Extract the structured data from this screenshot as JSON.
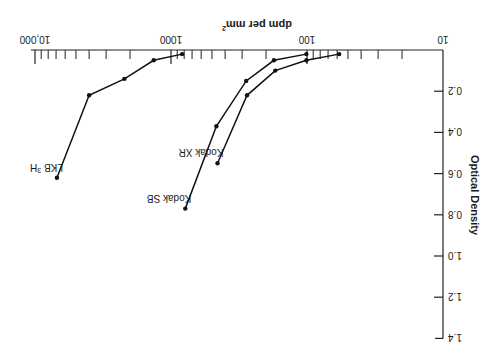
{
  "chart_data": {
    "type": "line",
    "title": "",
    "orientation_note_visible": "image rendered rotated 180 degrees",
    "xlabel": "dpm per mm²",
    "xlabel_main": "dpm per mm",
    "xlabel_sup": "2",
    "ylabel": "Optical Density",
    "xscale": "log",
    "xlim": [
      10,
      10000
    ],
    "ylim": [
      0,
      1.4
    ],
    "x_tick_labels": [
      "10",
      "100",
      "1000",
      "10,000"
    ],
    "x_tick_values": [
      10,
      100,
      1000,
      10000
    ],
    "y_tick_labels": [
      "0.2",
      "0.4",
      "0.6",
      "0.8",
      "1.0",
      "1.2",
      "1.4"
    ],
    "y_tick_values": [
      0.2,
      0.4,
      0.6,
      0.8,
      1.0,
      1.2,
      1.4
    ],
    "grid": false,
    "legend": "inline labels at curve ends",
    "series": [
      {
        "name": "Kodak XR",
        "label": "Kodak XR",
        "x": [
          58,
          101,
          171,
          276,
          455
        ],
        "y": [
          0.02,
          0.05,
          0.1,
          0.22,
          0.55
        ]
      },
      {
        "name": "Kodak SB",
        "label": "Kodak SB",
        "x": [
          101,
          175,
          280,
          464,
          785
        ],
        "y": [
          0.02,
          0.05,
          0.15,
          0.37,
          0.77
        ]
      },
      {
        "name": "LKB ³H",
        "label_main": "LKB ",
        "label_sup": "3",
        "label_tail": "H",
        "x": [
          828,
          1340,
          2200,
          4000,
          6900
        ],
        "y": [
          0.02,
          0.05,
          0.14,
          0.22,
          0.62
        ]
      }
    ]
  }
}
